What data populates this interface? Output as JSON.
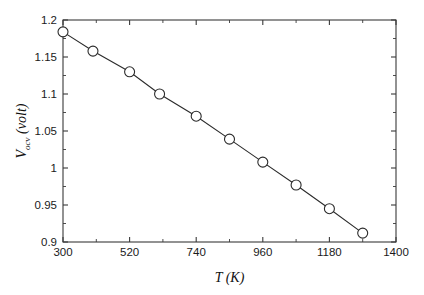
{
  "chart_data": {
    "type": "line",
    "title": "",
    "xlabel": "T (K)",
    "xlabel_symbol": "T",
    "xlabel_unit": "(K)",
    "ylabel": "V_ocv (volt)",
    "ylabel_symbol": "V",
    "ylabel_subscript": "ocv",
    "ylabel_unit": "(volt)",
    "x": [
      300,
      399,
      520,
      619,
      740,
      850,
      960,
      1070,
      1180,
      1290
    ],
    "values": [
      1.184,
      1.158,
      1.13,
      1.1,
      1.07,
      1.039,
      1.008,
      0.977,
      0.945,
      0.912
    ],
    "series": [
      {
        "name": "Vocv vs T",
        "x": [
          300,
          399,
          520,
          619,
          740,
          850,
          960,
          1070,
          1180,
          1290
        ],
        "values": [
          1.184,
          1.158,
          1.13,
          1.1,
          1.07,
          1.039,
          1.008,
          0.977,
          0.945,
          0.912
        ]
      }
    ],
    "xlim": [
      300,
      1400
    ],
    "ylim": [
      0.9,
      1.2
    ],
    "x_major_ticks": [
      300,
      520,
      740,
      960,
      1180,
      1400
    ],
    "x_major_tick_labels": [
      "300",
      "520",
      "740",
      "960",
      "1180",
      "1400"
    ],
    "x_minor_ticks": [
      410,
      630,
      850,
      1070,
      1290
    ],
    "y_major_ticks": [
      0.9,
      0.95,
      1.0,
      1.05,
      1.1,
      1.15,
      1.2
    ],
    "y_major_tick_labels": [
      "0.9",
      "0.95",
      "1",
      "1.05",
      "1.1",
      "1.15",
      "1.2"
    ],
    "y_minor_ticks": [
      0.925,
      0.975,
      1.025,
      1.075,
      1.125,
      1.175
    ],
    "grid": false,
    "legend": false,
    "legend_position": "none",
    "marker": "open-circle",
    "marker_size": 5,
    "line_color": "#2b2b2b",
    "marker_face_color": "#ffffff",
    "background_color": "#ffffff",
    "axis_color": "#3a3a3a"
  },
  "figure": {
    "plot_left": 63,
    "plot_right": 396,
    "plot_top": 20,
    "plot_bottom": 242
  }
}
